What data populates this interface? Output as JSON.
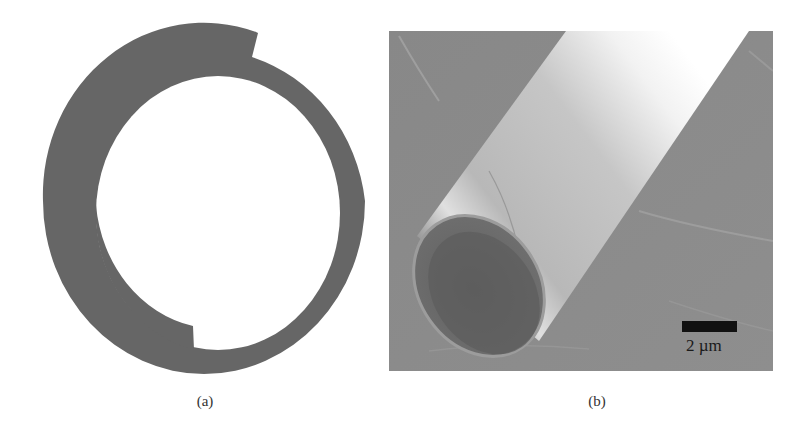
{
  "figure": {
    "panels": [
      {
        "id": "a",
        "label": "(a)",
        "description": "Cross-section of a rolled-up tube: a gray ring with a spiral step (outer and inner wall offset)",
        "fill_color": "#666666"
      },
      {
        "id": "b",
        "label": "(b)",
        "description": "SEM micrograph of a rolled-up microtube lying diagonally on a substrate, open end at lower left",
        "scale_bar": {
          "label": "2 µm",
          "color": "#111111"
        }
      }
    ]
  }
}
